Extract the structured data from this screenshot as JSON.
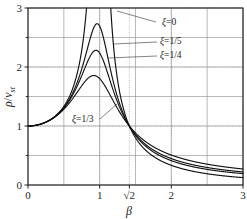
{
  "chart_data": {
    "type": "line",
    "title": "",
    "xlabel": "β",
    "ylabel": "ρ/v_st",
    "xlim": [
      0,
      3
    ],
    "ylim": [
      0,
      3
    ],
    "grid": true,
    "grid_major_x": [
      0,
      0.5,
      1,
      1.5,
      2,
      2.5,
      3
    ],
    "grid_major_y": [
      0,
      0.5,
      1,
      1.5,
      2,
      2.5,
      3
    ],
    "grid_dotted_x": [
      1,
      1.4142,
      2,
      3
    ],
    "grid_dotted_y": [
      1,
      2,
      3
    ],
    "xticks": [
      {
        "value": 0,
        "label": "0"
      },
      {
        "value": 1,
        "label": "1"
      },
      {
        "value": 1.4142,
        "label": "√2"
      },
      {
        "value": 2,
        "label": "2"
      },
      {
        "value": 3,
        "label": "3"
      }
    ],
    "yticks": [
      {
        "value": 0,
        "label": "0"
      },
      {
        "value": 1,
        "label": "1"
      },
      {
        "value": 2,
        "label": "2"
      },
      {
        "value": 3,
        "label": "3"
      }
    ],
    "minor_tick_values_y": [
      0.5,
      1.5,
      2.5
    ],
    "crossover_point": {
      "x": 1.4142,
      "y": 1
    },
    "legend_position": "inline-annotations",
    "series": [
      {
        "name": "ξ=0",
        "zeta": 0.0,
        "label": "ξ=0",
        "peak": {
          "x": 1.0,
          "y": 3.0
        },
        "values_note": "T = sqrt((1+(2*z*b)^2)/((1-b^2)^2+(2*z*b)^2))",
        "x": [
          0,
          0.2,
          0.4,
          0.6,
          0.8,
          0.9,
          0.95,
          1.05,
          1.1,
          1.2,
          1.4142,
          1.6,
          2,
          2.5,
          3
        ],
        "y": [
          1.0,
          1.042,
          1.19,
          1.563,
          2.778,
          5.263,
          10.26,
          9.3,
          4.762,
          2.273,
          1.0,
          0.641,
          0.333,
          0.19,
          0.125
        ]
      },
      {
        "name": "ξ=1/5",
        "zeta": 0.2,
        "label": "ξ=1/5",
        "peak": {
          "x": 0.95,
          "y": 2.72
        },
        "x": [
          0,
          0.2,
          0.4,
          0.6,
          0.8,
          0.95,
          1.0,
          1.1,
          1.2,
          1.4142,
          1.6,
          2,
          2.5,
          3
        ],
        "y": [
          1.0,
          1.043,
          1.199,
          1.58,
          2.3,
          2.72,
          2.69,
          2.14,
          1.66,
          1.0,
          0.76,
          0.45,
          0.29,
          0.22
        ]
      },
      {
        "name": "ξ=1/4",
        "zeta": 0.25,
        "label": "ξ=1/4",
        "peak": {
          "x": 0.93,
          "y": 2.27
        },
        "x": [
          0,
          0.2,
          0.4,
          0.6,
          0.8,
          0.93,
          1.0,
          1.1,
          1.2,
          1.4142,
          1.6,
          2,
          2.5,
          3
        ],
        "y": [
          1.0,
          1.043,
          1.2,
          1.57,
          2.13,
          2.27,
          2.23,
          1.93,
          1.58,
          1.0,
          0.79,
          0.49,
          0.32,
          0.245
        ]
      },
      {
        "name": "ξ=1/3",
        "zeta": 0.3333,
        "label": "ξ=1/3",
        "peak": {
          "x": 0.9,
          "y": 1.82
        },
        "x": [
          0,
          0.2,
          0.4,
          0.6,
          0.8,
          0.9,
          1.0,
          1.1,
          1.2,
          1.4142,
          1.6,
          2,
          2.5,
          3
        ],
        "y": [
          1.0,
          1.044,
          1.2,
          1.54,
          1.78,
          1.82,
          1.8,
          1.66,
          1.46,
          1.0,
          0.84,
          0.56,
          0.38,
          0.29
        ]
      }
    ],
    "annotations": [
      {
        "text": "ξ=0",
        "x_px": 162,
        "y_px": 25,
        "leader": [
          [
            156,
            22
          ],
          [
            117,
            11
          ]
        ]
      },
      {
        "text": "ξ=1/5",
        "x_px": 160,
        "y_px": 44,
        "leader": [
          [
            157,
            42
          ],
          [
            114,
            44
          ]
        ]
      },
      {
        "text": "ξ=1/4",
        "x_px": 160,
        "y_px": 58,
        "leader": [
          [
            157,
            56
          ],
          [
            108,
            58
          ]
        ]
      },
      {
        "text": "ξ=1/3",
        "x_px": 72,
        "y_px": 122,
        "leader": [
          [
            100,
            119
          ],
          [
            117,
            104
          ]
        ]
      }
    ]
  },
  "axis": {
    "x_label": "β",
    "y_label_rho": "ρ",
    "y_label_slash": "/",
    "y_label_v": "v",
    "y_label_sub": "st"
  }
}
